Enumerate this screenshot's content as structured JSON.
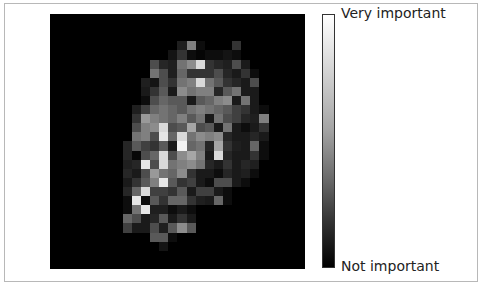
{
  "chart_data": {
    "type": "heatmap",
    "title": "",
    "xlabel": "",
    "ylabel": "",
    "grid": false,
    "shape": [
      28,
      28
    ],
    "colormap": "gray",
    "colorbar": {
      "position": "right",
      "top_label": "Very important",
      "bottom_label": "Not important",
      "range": [
        0,
        1
      ]
    },
    "values": [
      [
        0,
        0,
        0,
        0,
        0,
        0,
        0,
        0,
        0,
        0,
        0,
        0,
        0,
        0,
        0,
        0,
        0,
        0,
        0,
        0,
        0,
        0,
        0,
        0,
        0,
        0,
        0,
        0
      ],
      [
        0,
        0,
        0,
        0,
        0,
        0,
        0,
        0,
        0,
        0,
        0,
        0,
        0,
        0,
        0,
        0,
        0,
        0,
        0,
        0,
        0,
        0,
        0,
        0,
        0,
        0,
        0,
        0
      ],
      [
        0,
        0,
        0,
        0,
        0,
        0,
        0,
        0,
        0,
        0,
        0,
        0,
        0,
        0,
        0,
        0,
        0,
        0,
        0,
        0,
        0,
        0,
        0,
        0,
        0,
        0,
        0,
        0
      ],
      [
        0,
        0,
        0,
        0,
        0,
        0,
        0,
        0,
        0,
        0,
        0,
        0,
        0,
        0,
        0.12,
        0.5,
        0.05,
        0,
        0,
        0,
        0.2,
        0,
        0,
        0,
        0,
        0,
        0,
        0
      ],
      [
        0,
        0,
        0,
        0,
        0,
        0,
        0,
        0,
        0,
        0,
        0,
        0,
        0,
        0.08,
        0.2,
        0.05,
        0.02,
        0.05,
        0.05,
        0.08,
        0.05,
        0,
        0,
        0,
        0,
        0,
        0,
        0
      ],
      [
        0,
        0,
        0,
        0,
        0,
        0,
        0,
        0,
        0,
        0,
        0,
        0.3,
        0.15,
        0.12,
        0.45,
        0.55,
        0.85,
        0.2,
        0.15,
        0.12,
        0.3,
        0.1,
        0,
        0,
        0,
        0,
        0,
        0
      ],
      [
        0,
        0,
        0,
        0,
        0,
        0,
        0,
        0,
        0,
        0,
        0,
        0.45,
        0.3,
        0.12,
        0.4,
        0.2,
        0.2,
        0.2,
        0.3,
        0.15,
        0.1,
        0.2,
        0.05,
        0,
        0,
        0,
        0,
        0
      ],
      [
        0,
        0,
        0,
        0,
        0,
        0,
        0,
        0,
        0,
        0,
        0.12,
        0.08,
        0.3,
        0.2,
        0.45,
        0.5,
        0.85,
        0.45,
        0.35,
        0.2,
        0.15,
        0.1,
        0.3,
        0,
        0,
        0,
        0,
        0
      ],
      [
        0,
        0,
        0,
        0,
        0,
        0,
        0,
        0,
        0,
        0,
        0.1,
        0.2,
        0.35,
        0.1,
        0.55,
        0.45,
        0.5,
        0.5,
        0.15,
        0.35,
        0.45,
        0.1,
        0.1,
        0,
        0,
        0,
        0,
        0
      ],
      [
        0,
        0,
        0,
        0,
        0,
        0,
        0,
        0,
        0,
        0,
        0.05,
        0.3,
        0.4,
        0.35,
        0.35,
        0.1,
        0.35,
        0.4,
        0.5,
        0.55,
        0.1,
        0.45,
        0.1,
        0,
        0,
        0,
        0,
        0
      ],
      [
        0,
        0,
        0,
        0,
        0,
        0,
        0,
        0,
        0,
        0.12,
        0.25,
        0.4,
        0.45,
        0.4,
        0.35,
        0.45,
        0.5,
        0.45,
        0.4,
        0.35,
        0.25,
        0.2,
        0.1,
        0.05,
        0,
        0,
        0,
        0
      ],
      [
        0,
        0,
        0,
        0,
        0,
        0,
        0,
        0,
        0,
        0.2,
        0.6,
        0.5,
        0.45,
        0.4,
        0.5,
        0.35,
        0.45,
        0.1,
        0.45,
        0.3,
        0.25,
        0.15,
        0.12,
        0.5,
        0,
        0,
        0,
        0
      ],
      [
        0,
        0,
        0,
        0,
        0,
        0,
        0,
        0,
        0,
        0.3,
        0.5,
        0.55,
        0.85,
        0.3,
        0.35,
        0.65,
        0.3,
        0.35,
        0.1,
        0.45,
        0.1,
        0.05,
        0.1,
        0.2,
        0,
        0,
        0,
        0
      ],
      [
        0,
        0,
        0,
        0,
        0,
        0,
        0,
        0,
        0,
        0.45,
        0.5,
        0.3,
        0.9,
        0.4,
        0.85,
        0.45,
        0.55,
        0.5,
        0.55,
        0.15,
        0.1,
        0.1,
        0.15,
        0.1,
        0,
        0,
        0,
        0
      ],
      [
        0,
        0,
        0,
        0,
        0,
        0,
        0,
        0,
        0.15,
        0.35,
        0.25,
        0.2,
        0.35,
        0.1,
        0.95,
        0.4,
        0.45,
        0.15,
        0.65,
        0.2,
        0.12,
        0.1,
        0.4,
        0.05,
        0,
        0,
        0,
        0
      ],
      [
        0,
        0,
        0,
        0,
        0,
        0,
        0,
        0,
        0.15,
        0.03,
        0.3,
        0.4,
        0.85,
        0.3,
        0.55,
        0.65,
        0.5,
        0.1,
        0.85,
        0.15,
        0.1,
        0.1,
        0.2,
        0.05,
        0,
        0,
        0,
        0
      ],
      [
        0,
        0,
        0,
        0,
        0,
        0,
        0,
        0,
        0.12,
        0.15,
        0.9,
        0.3,
        0.85,
        0.45,
        0.5,
        0.55,
        0.45,
        0.15,
        0.1,
        0.2,
        0.1,
        0.15,
        0.12,
        0,
        0,
        0,
        0,
        0
      ],
      [
        0,
        0,
        0,
        0,
        0,
        0,
        0,
        0,
        0.15,
        0.1,
        0.3,
        0.6,
        0.45,
        0.4,
        0.55,
        0.2,
        0.1,
        0.1,
        0.05,
        0.15,
        0.1,
        0.12,
        0.05,
        0,
        0,
        0,
        0,
        0
      ],
      [
        0,
        0,
        0,
        0,
        0,
        0,
        0,
        0,
        0.1,
        0.2,
        0.35,
        0.5,
        0.9,
        0.35,
        0.2,
        0.25,
        0.1,
        0.05,
        0.3,
        0.3,
        0.1,
        0.05,
        0,
        0,
        0,
        0,
        0,
        0
      ],
      [
        0,
        0,
        0,
        0,
        0,
        0,
        0,
        0,
        0.15,
        0.4,
        0.85,
        0.25,
        0.25,
        0.2,
        0.35,
        0.1,
        0.25,
        0.25,
        0.1,
        0.05,
        0,
        0,
        0,
        0,
        0,
        0,
        0,
        0
      ],
      [
        0,
        0,
        0,
        0,
        0,
        0,
        0,
        0,
        0.05,
        0.9,
        0.05,
        0.35,
        0.2,
        0.4,
        0.4,
        0.2,
        0.12,
        0.1,
        0.4,
        0.05,
        0,
        0,
        0,
        0,
        0,
        0,
        0,
        0
      ],
      [
        0,
        0,
        0,
        0,
        0,
        0,
        0,
        0,
        0.05,
        0.45,
        0.9,
        0.12,
        0.12,
        0.05,
        0.1,
        0.05,
        0,
        0,
        0,
        0,
        0,
        0,
        0,
        0,
        0,
        0,
        0,
        0
      ],
      [
        0,
        0,
        0,
        0,
        0,
        0,
        0,
        0,
        0.4,
        0.3,
        0.1,
        0.15,
        0.35,
        0.1,
        0.2,
        0.1,
        0,
        0,
        0,
        0,
        0,
        0,
        0,
        0,
        0,
        0,
        0,
        0
      ],
      [
        0,
        0,
        0,
        0,
        0,
        0,
        0,
        0,
        0.25,
        0.1,
        0.1,
        0.3,
        0.12,
        0.35,
        0.55,
        0.35,
        0,
        0,
        0,
        0,
        0,
        0,
        0,
        0,
        0,
        0,
        0,
        0
      ],
      [
        0,
        0,
        0,
        0,
        0,
        0,
        0,
        0,
        0,
        0,
        0,
        0.35,
        0.35,
        0.05,
        0,
        0,
        0,
        0,
        0,
        0,
        0,
        0,
        0,
        0,
        0,
        0,
        0,
        0
      ],
      [
        0,
        0,
        0,
        0,
        0,
        0,
        0,
        0,
        0,
        0,
        0,
        0,
        0.08,
        0,
        0,
        0,
        0,
        0,
        0,
        0,
        0,
        0,
        0,
        0,
        0,
        0,
        0,
        0
      ],
      [
        0,
        0,
        0,
        0,
        0,
        0,
        0,
        0,
        0,
        0,
        0,
        0,
        0,
        0,
        0,
        0,
        0,
        0,
        0,
        0,
        0,
        0,
        0,
        0,
        0,
        0,
        0,
        0
      ],
      [
        0,
        0,
        0,
        0,
        0,
        0,
        0,
        0,
        0,
        0,
        0,
        0,
        0,
        0,
        0,
        0,
        0,
        0,
        0,
        0,
        0,
        0,
        0,
        0,
        0,
        0,
        0,
        0
      ]
    ]
  }
}
